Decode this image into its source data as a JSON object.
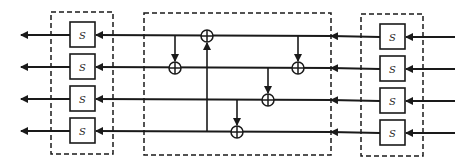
{
  "diagram": {
    "title": "",
    "rows": 4,
    "colors": {
      "stroke": "#1a1a1a",
      "background": "#ffffff"
    },
    "left_sbox_group": {
      "labels": [
        "S",
        "S",
        "S",
        "S"
      ]
    },
    "right_sbox_group": {
      "labels": [
        "S",
        "S",
        "S",
        "S"
      ]
    },
    "mixing_layer": {
      "xor_nodes": [
        {
          "row": 1,
          "input_from_row": 4,
          "direction": "up"
        },
        {
          "row": 2,
          "input_from_row": 1,
          "direction": "down",
          "position": "left"
        },
        {
          "row": 2,
          "input_from_row": 1,
          "direction": "down",
          "position": "right"
        },
        {
          "row": 3,
          "input_from_row": 2,
          "direction": "down"
        },
        {
          "row": 4,
          "input_from_row": 3,
          "direction": "down"
        }
      ]
    },
    "flow_direction": "right-to-left"
  }
}
